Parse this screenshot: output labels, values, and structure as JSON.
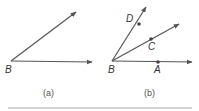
{
  "figure_a": {
    "caption": "(a)",
    "vertex_label": "B",
    "rays": [
      "upper-ray",
      "horizontal-ray"
    ]
  },
  "figure_b": {
    "caption": "(b)",
    "vertex_label": "B",
    "points": [
      {
        "label": "D",
        "ray": "steep"
      },
      {
        "label": "C",
        "ray": "middle"
      },
      {
        "label": "A",
        "ray": "horizontal"
      }
    ]
  },
  "colors": {
    "line": "#555555",
    "text": "#333333",
    "divider": "#aaaaaa"
  }
}
